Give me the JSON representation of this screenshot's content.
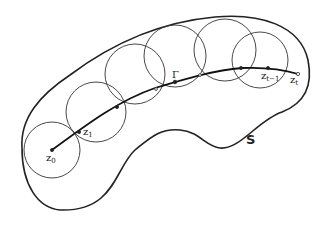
{
  "diagram": {
    "region_label": "S",
    "curve_label": "Γ",
    "points": {
      "z0": {
        "base": "z",
        "sub": "0"
      },
      "z1": {
        "base": "z",
        "sub": "1"
      },
      "zt_minus_1": {
        "base": "z",
        "sub": "t−1"
      },
      "zt": {
        "base": "z",
        "sub": "t"
      }
    },
    "circle_count": 6,
    "colors": {
      "stroke": "#222222",
      "background": "#ffffff"
    }
  }
}
